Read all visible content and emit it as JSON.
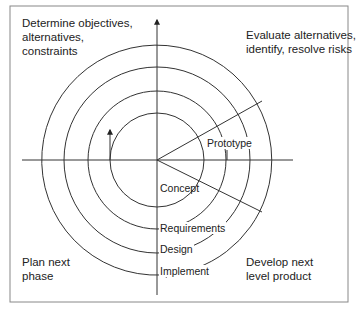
{
  "diagram": {
    "quadrants": {
      "top_left": "Determine objectives,\nalternatives,\nconstraints",
      "top_right": "Evaluate alternatives,\nidentify, resolve risks",
      "bottom_left": "Plan next\nphase",
      "bottom_right": "Develop next\nlevel product"
    },
    "ring_labels": {
      "prototype": "Prototype",
      "concept": "Concept",
      "requirements": "Requirements",
      "design": "Design",
      "implement": "Implement"
    },
    "colors": {
      "line": "#333333",
      "frame": "#888888",
      "text": "#222222"
    }
  }
}
